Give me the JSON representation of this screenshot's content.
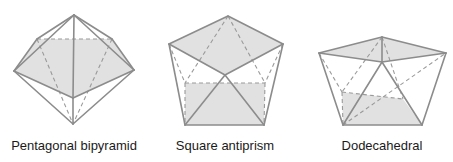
{
  "colors": {
    "background": "#ffffff",
    "face_fill": "#e1e1e1",
    "edge_solid": "#8c8c8c",
    "edge_dashed": "#9a9a9a",
    "label_text": "#1a1a1a"
  },
  "shapes": [
    {
      "id": "pentagonal-bipyramid",
      "label": "Pentagonal bipyramid",
      "label_x": 74,
      "vertices": {
        "apex_top": [
          74,
          15
        ],
        "left": [
          14,
          71
        ],
        "back_left": [
          37,
          39
        ],
        "back_right": [
          112,
          39
        ],
        "right": [
          134,
          70
        ],
        "front": [
          73,
          98
        ],
        "apex_bottom": [
          73,
          124
        ]
      },
      "shaded_faces": [
        [
          "left",
          "back_left",
          "back_right",
          "right",
          "front"
        ]
      ],
      "solid_edges": [
        [
          "apex_top",
          "left"
        ],
        [
          "apex_top",
          "back_left"
        ],
        [
          "apex_top",
          "back_right"
        ],
        [
          "apex_top",
          "right"
        ],
        [
          "apex_top",
          "front"
        ],
        [
          "left",
          "back_left"
        ],
        [
          "right",
          "back_right"
        ],
        [
          "left",
          "front"
        ],
        [
          "right",
          "front"
        ],
        [
          "left",
          "apex_bottom"
        ],
        [
          "right",
          "apex_bottom"
        ],
        [
          "front",
          "apex_bottom"
        ]
      ],
      "dashed_edges": [
        [
          "back_left",
          "back_right"
        ],
        [
          "back_left",
          "apex_bottom"
        ],
        [
          "back_right",
          "apex_bottom"
        ]
      ]
    },
    {
      "id": "square-antiprism",
      "label": "Square antiprism",
      "label_x": 225,
      "vertices": {
        "top": [
          228,
          16
        ],
        "top_left": [
          169,
          44
        ],
        "top_right": [
          283,
          44
        ],
        "top_front": [
          225,
          75
        ],
        "back_left": [
          185,
          83
        ],
        "back_right": [
          265,
          83
        ],
        "bottom_left": [
          185,
          125
        ],
        "bottom_right": [
          264,
          125
        ]
      },
      "shaded_faces": [
        [
          "top",
          "top_right",
          "top_front",
          "top_left"
        ],
        [
          "back_left",
          "back_right",
          "bottom_right",
          "bottom_left"
        ]
      ],
      "solid_edges": [
        [
          "top",
          "top_left"
        ],
        [
          "top",
          "top_right"
        ],
        [
          "top_left",
          "top_front"
        ],
        [
          "top_right",
          "top_front"
        ],
        [
          "top_left",
          "bottom_left"
        ],
        [
          "top_right",
          "bottom_right"
        ],
        [
          "top_front",
          "bottom_left"
        ],
        [
          "top_front",
          "bottom_right"
        ],
        [
          "bottom_left",
          "bottom_right"
        ]
      ],
      "dashed_edges": [
        [
          "top",
          "back_left"
        ],
        [
          "top",
          "back_right"
        ],
        [
          "top_left",
          "back_left"
        ],
        [
          "top_right",
          "back_right"
        ],
        [
          "back_left",
          "back_right"
        ],
        [
          "back_left",
          "bottom_left"
        ],
        [
          "back_right",
          "bottom_right"
        ]
      ]
    },
    {
      "id": "dodecahedral",
      "label": "Dodecahedral",
      "label_x": 382,
      "vertices": {
        "top": [
          382,
          37
        ],
        "left": [
          319,
          53
        ],
        "right": [
          446,
          53
        ],
        "front": [
          382,
          62
        ],
        "back_left": [
          342,
          92
        ],
        "back_right": [
          403,
          99
        ],
        "bottom_left": [
          343,
          125
        ],
        "bottom_right": [
          422,
          125
        ]
      },
      "shaded_faces": [
        [
          "top",
          "right",
          "front",
          "left"
        ],
        [
          "back_left",
          "back_right",
          "bottom_right",
          "bottom_left"
        ]
      ],
      "solid_edges": [
        [
          "top",
          "left"
        ],
        [
          "top",
          "right"
        ],
        [
          "left",
          "front"
        ],
        [
          "right",
          "front"
        ],
        [
          "top",
          "front"
        ],
        [
          "left",
          "bottom_left"
        ],
        [
          "right",
          "bottom_right"
        ],
        [
          "front",
          "bottom_left"
        ],
        [
          "front",
          "bottom_right"
        ],
        [
          "bottom_left",
          "bottom_right"
        ]
      ],
      "dashed_edges": [
        [
          "left",
          "back_left"
        ],
        [
          "top",
          "back_left"
        ],
        [
          "top",
          "back_right"
        ],
        [
          "back_left",
          "back_right"
        ],
        [
          "back_left",
          "bottom_left"
        ],
        [
          "bottom_left",
          "right"
        ]
      ]
    }
  ]
}
